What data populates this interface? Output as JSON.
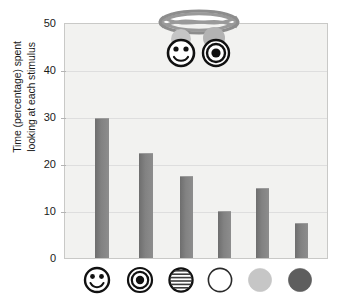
{
  "chart_data": {
    "type": "bar",
    "title": "",
    "subtitle": "",
    "xlabel": "",
    "ylabel": "Time (percentage) spent\nlooking at each stimulus",
    "ylim": [
      0,
      50
    ],
    "yticks": [
      0,
      10,
      20,
      30,
      40,
      50
    ],
    "ytick_labels": [
      "0",
      "10",
      "20",
      "30",
      "40",
      "50"
    ],
    "grid": true,
    "legend": "none",
    "categories": [
      "smiley-face",
      "bullseye",
      "striped-circle",
      "white-circle",
      "light-gray-circle",
      "dark-gray-circle"
    ],
    "category_labels": [
      "",
      "",
      "",
      "",
      "",
      ""
    ],
    "values": [
      30,
      22.5,
      17.5,
      10,
      15,
      7.5
    ],
    "bar_color": "#7d7d7d",
    "plot_background": "#f2f2f0",
    "gridline_color": "#dedede",
    "axis_color": "#c9c9c7"
  },
  "axis": {
    "y_title": "Time (percentage) spent\nlooking at each stimulus",
    "y_ticks": [
      {
        "value": 50,
        "label": "50"
      },
      {
        "value": 40,
        "label": "40"
      },
      {
        "value": 30,
        "label": "30"
      },
      {
        "value": 20,
        "label": "20"
      },
      {
        "value": 10,
        "label": "10"
      },
      {
        "value": 0,
        "label": "0"
      }
    ]
  },
  "stimuli": [
    {
      "name": "smiley-face-icon",
      "value": 30,
      "fill": "#ffffff",
      "stroke": "#111111"
    },
    {
      "name": "bullseye-icon",
      "value": 22.5,
      "fill": "#ffffff",
      "stroke": "#111111"
    },
    {
      "name": "striped-circle-icon",
      "value": 17.5,
      "fill": "#ffffff",
      "stroke": "#111111"
    },
    {
      "name": "white-circle-icon",
      "value": 10,
      "fill": "#ffffff",
      "stroke": "#2a2a2a"
    },
    {
      "name": "light-gray-circle-icon",
      "value": 15,
      "fill": "#c6c6c6",
      "stroke": "#c6c6c6"
    },
    {
      "name": "dark-gray-circle-icon",
      "value": 7.5,
      "fill": "#5e5e5e",
      "stroke": "#5e5e5e"
    }
  ],
  "inset": {
    "name": "mobile-apparatus-illustration",
    "description": "Oval hoop with crossing bands suspending a smiley face and a bullseye stimulus",
    "hoop_color": "#8d8d8d",
    "hanger_left_color": "#c5c5c5",
    "hanger_right_color": "#b3b3b3",
    "stimulus_left": "smiley-face",
    "stimulus_right": "bullseye"
  }
}
